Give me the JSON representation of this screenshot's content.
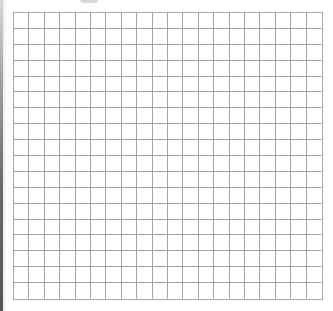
{
  "page": {
    "width": 333,
    "height": 311,
    "background": "#ffffff"
  },
  "grid_paper": {
    "columns": 20,
    "rows": 18,
    "cell_width_px": 15.5,
    "cell_height_px": 16,
    "line_color": "#a3a3a3",
    "border_color": "#a8a8a8",
    "left": 13,
    "top": 12,
    "width": 310,
    "height": 288
  },
  "edge_shadow": {
    "side": "left",
    "color": "#555555"
  }
}
